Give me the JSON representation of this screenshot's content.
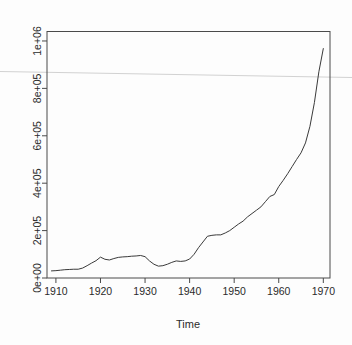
{
  "chart_data": {
    "type": "line",
    "title": "",
    "xlabel": "Time",
    "ylabel": "",
    "xlim": [
      1908,
      1971.5
    ],
    "ylim": [
      0,
      1040000
    ],
    "grid": false,
    "legend": "none",
    "x_ticks": [
      1910,
      1920,
      1930,
      1940,
      1950,
      1960,
      1970
    ],
    "x_tick_labels": [
      "1910",
      "1920",
      "1930",
      "1940",
      "1950",
      "1960",
      "1970"
    ],
    "y_ticks": [
      0,
      200000,
      400000,
      600000,
      800000,
      1000000
    ],
    "y_tick_labels": [
      "0e+00",
      "2e+05",
      "4e+05",
      "6e+05",
      "8e+05",
      "1e+06"
    ],
    "series": [
      {
        "name": "series-1",
        "color": "#3a3a3a",
        "x": [
          1909,
          1910,
          1911,
          1912,
          1913,
          1914,
          1915,
          1916,
          1917,
          1918,
          1919,
          1920,
          1921,
          1922,
          1923,
          1924,
          1925,
          1926,
          1927,
          1928,
          1929,
          1930,
          1931,
          1932,
          1933,
          1934,
          1935,
          1936,
          1937,
          1938,
          1939,
          1940,
          1941,
          1942,
          1943,
          1944,
          1945,
          1946,
          1947,
          1948,
          1949,
          1950,
          1951,
          1952,
          1953,
          1954,
          1955,
          1956,
          1957,
          1958,
          1959,
          1960,
          1961,
          1962,
          1963,
          1964,
          1965,
          1966,
          1967,
          1968,
          1969,
          1970
        ],
        "y": [
          30000,
          31000,
          33000,
          35000,
          36000,
          37000,
          37000,
          42000,
          52000,
          63000,
          73000,
          88000,
          79000,
          76000,
          82000,
          87000,
          89000,
          90000,
          92000,
          93000,
          95000,
          90000,
          72000,
          58000,
          50000,
          52000,
          58000,
          66000,
          72000,
          70000,
          72000,
          80000,
          100000,
          128000,
          152000,
          176000,
          180000,
          182000,
          182000,
          190000,
          200000,
          214000,
          228000,
          240000,
          258000,
          272000,
          286000,
          300000,
          322000,
          344000,
          352000,
          386000,
          412000,
          440000,
          470000,
          500000,
          528000,
          570000,
          640000,
          740000,
          870000,
          968000
        ]
      }
    ],
    "annotations": [
      {
        "name": "scan-artifact-line",
        "kind": "horizontal-streak",
        "color": "#cfcfcf"
      }
    ]
  },
  "axes": {
    "box_color": "#4a4a4a",
    "tick_color": "#4a4a4a",
    "line_color": "#3a3a3a"
  },
  "labels": {
    "x_axis_title": "Time"
  }
}
